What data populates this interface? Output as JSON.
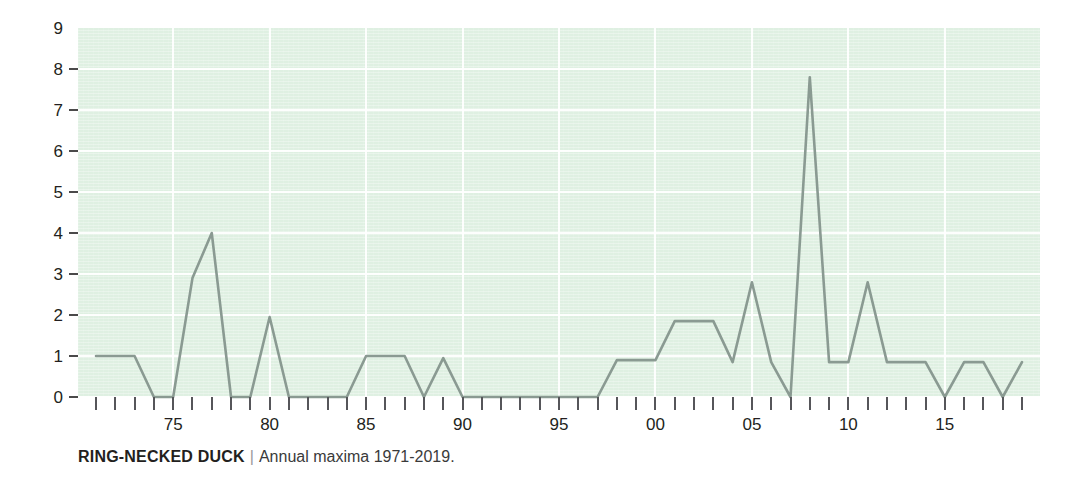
{
  "caption": {
    "species": "RING-NECKED DUCK",
    "separator": "|",
    "subtitle": "Annual maxima 1971-2019."
  },
  "colors": {
    "plot_background": "#dff0e2",
    "gridline": "#ffffff",
    "line": "#8a9a92",
    "text": "#231f20",
    "tick": "#56565a"
  },
  "chart_data": {
    "type": "line",
    "title": "RING-NECKED DUCK",
    "subtitle": "Annual maxima 1971-2019.",
    "xlabel": "",
    "ylabel": "",
    "grid": true,
    "legend": false,
    "xlim": [
      1971,
      2019
    ],
    "ylim": [
      0,
      9
    ],
    "y_ticks": [
      0,
      1,
      2,
      3,
      4,
      5,
      6,
      7,
      8,
      9
    ],
    "y_tick_labels": [
      "0",
      "1",
      "2",
      "3",
      "4",
      "5",
      "6",
      "7",
      "8",
      "9"
    ],
    "x_tick_years": [
      1971,
      1972,
      1973,
      1974,
      1975,
      1976,
      1977,
      1978,
      1979,
      1980,
      1981,
      1982,
      1983,
      1984,
      1985,
      1986,
      1987,
      1988,
      1989,
      1990,
      1991,
      1992,
      1993,
      1994,
      1995,
      1996,
      1997,
      1998,
      1999,
      2000,
      2001,
      2002,
      2003,
      2004,
      2005,
      2006,
      2007,
      2008,
      2009,
      2010,
      2011,
      2012,
      2013,
      2014,
      2015,
      2016,
      2017,
      2018,
      2019
    ],
    "x_labeled_years": [
      1975,
      1980,
      1985,
      1990,
      1995,
      2000,
      2005,
      2010,
      2015
    ],
    "x_labels": [
      "75",
      "80",
      "85",
      "90",
      "95",
      "00",
      "05",
      "10",
      "15"
    ],
    "x": [
      1971,
      1972,
      1973,
      1974,
      1975,
      1976,
      1977,
      1978,
      1979,
      1980,
      1981,
      1982,
      1983,
      1984,
      1985,
      1986,
      1987,
      1988,
      1989,
      1990,
      1991,
      1992,
      1993,
      1994,
      1995,
      1996,
      1997,
      1998,
      1999,
      2000,
      2001,
      2002,
      2003,
      2004,
      2005,
      2006,
      2007,
      2008,
      2009,
      2010,
      2011,
      2012,
      2013,
      2014,
      2015,
      2016,
      2017,
      2018,
      2019
    ],
    "values": [
      1,
      1,
      1,
      0,
      0,
      2.9,
      4,
      0,
      0,
      1.95,
      0,
      0,
      0,
      0,
      1,
      1,
      1,
      0,
      0.95,
      0,
      0,
      0,
      0,
      0,
      0,
      0,
      0,
      0.9,
      0.9,
      0.9,
      1.85,
      1.85,
      1.85,
      0.85,
      2.8,
      0.85,
      0,
      7.8,
      0.85,
      0.85,
      2.8,
      0.85,
      0.85,
      0.85,
      0,
      0.85,
      0.85,
      0,
      0.85
    ]
  }
}
